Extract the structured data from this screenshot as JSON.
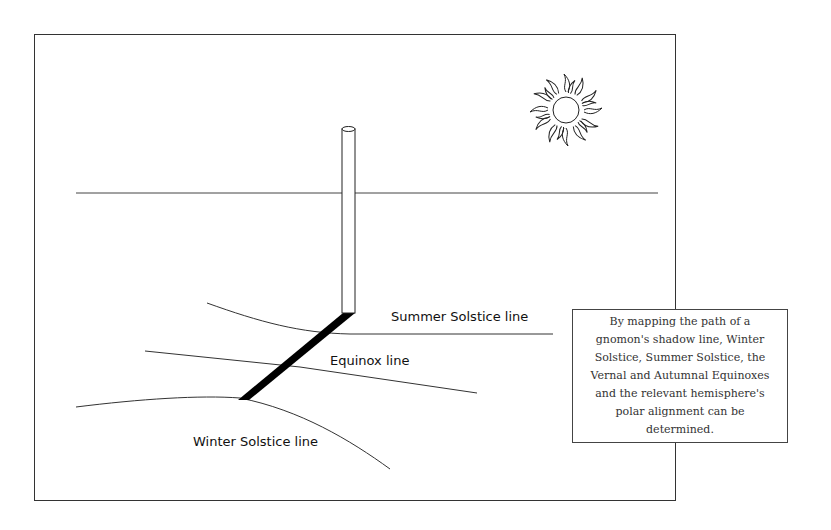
{
  "diagram": {
    "labels": {
      "summer": "Summer Solstice line",
      "equinox": "Equinox line",
      "winter": "Winter Solstice line"
    },
    "note": "By mapping the path of a gnomon's shadow line, Winter Solstice, Summer Solstice, the Vernal and Autumnal Equinoxes and the relevant hemisphere's polar alignment can be determined.",
    "icons": [
      "sun-icon",
      "gnomon",
      "shadow"
    ]
  }
}
